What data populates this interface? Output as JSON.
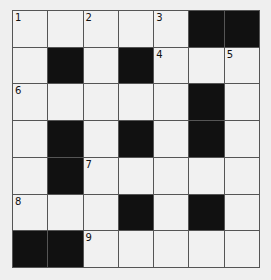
{
  "puzzle": {
    "rows": 7,
    "cols": 7,
    "colors": {
      "block": "#111111",
      "cell": "#f1f1f1",
      "line": "#555555"
    },
    "cells": [
      [
        {
          "n": "1"
        },
        {},
        {
          "n": "2"
        },
        {},
        {
          "n": "3"
        },
        {
          "b": 1
        },
        {
          "b": 1
        }
      ],
      [
        {},
        {
          "b": 1
        },
        {},
        {
          "b": 1
        },
        {
          "n": "4"
        },
        {},
        {
          "n": "5"
        }
      ],
      [
        {
          "n": "6"
        },
        {},
        {},
        {},
        {},
        {
          "b": 1
        },
        {}
      ],
      [
        {},
        {
          "b": 1
        },
        {},
        {
          "b": 1
        },
        {},
        {
          "b": 1
        },
        {}
      ],
      [
        {},
        {
          "b": 1
        },
        {
          "n": "7"
        },
        {},
        {},
        {},
        {}
      ],
      [
        {
          "n": "8"
        },
        {},
        {},
        {
          "b": 1
        },
        {},
        {
          "b": 1
        },
        {}
      ],
      [
        {
          "b": 1
        },
        {
          "b": 1
        },
        {
          "n": "9"
        },
        {},
        {},
        {},
        {}
      ]
    ]
  }
}
